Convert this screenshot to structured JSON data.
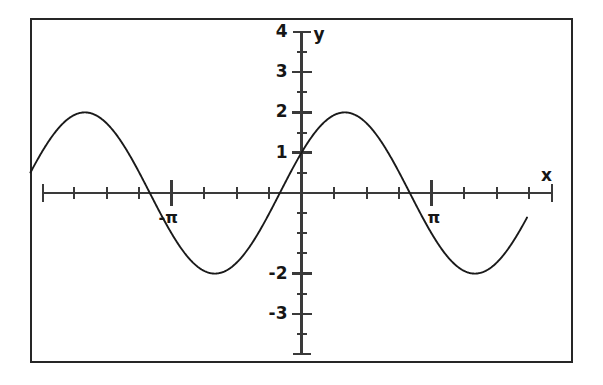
{
  "figure": {
    "background_color": "#ffffff",
    "border_color": "#262626",
    "curve_color": "#1a1a1a",
    "axis_color": "#3a3a3a",
    "text_color": "#161616"
  },
  "axes": {
    "x_axis_label": "x",
    "y_axis_label": "y",
    "x_tick_labels": [
      {
        "text": "-π",
        "value": -3.141592653589793
      },
      {
        "text": "π",
        "value": 3.141592653589793
      }
    ],
    "y_tick_labels": [
      {
        "text": "4",
        "value": 4
      },
      {
        "text": "3",
        "value": 3
      },
      {
        "text": "2",
        "value": 2
      },
      {
        "text": "1",
        "value": 1
      },
      {
        "text": "-2",
        "value": -2
      },
      {
        "text": "-3",
        "value": -3
      }
    ]
  },
  "chart_data": {
    "type": "line",
    "title": "",
    "subtitle": "",
    "xlabel": "x",
    "ylabel": "y",
    "xlim": [
      -7.35,
      5.8
    ],
    "ylim": [
      -4.0,
      4.0
    ],
    "grid": false,
    "legend": "none",
    "equation": "y = 2 sin(x + pi/6)",
    "amplitude": 2,
    "period": 6.283185307179586,
    "phase_shift": -0.5235987755982988,
    "vertical_shift": 0,
    "y_intercept": 1,
    "x_tick_interval": 0.7853981633974483,
    "y_tick_interval": 0.5,
    "x_major_ticks": [
      -3.141592653589793,
      3.141592653589793
    ],
    "y_major_ticks": [
      4,
      3,
      2,
      1,
      -2,
      -3
    ],
    "annotations": [
      {
        "text": "-π",
        "x": -3.141592653589793,
        "y": 0
      },
      {
        "text": "π",
        "x": 3.141592653589793,
        "y": 0
      },
      {
        "text": "x",
        "x": 5.6,
        "y": 0.42
      },
      {
        "text": "y",
        "x": 0.28,
        "y": 3.95
      }
    ],
    "series": [
      {
        "name": "2 sin(x + pi/6)",
        "color": "#1a1a1a",
        "x": [
          -6.55,
          -6.35,
          -6.15,
          -5.95,
          -5.75,
          -5.55,
          -5.35,
          -5.15,
          -4.95,
          -4.75,
          -4.55,
          -4.35,
          -4.15,
          -3.95,
          -3.75,
          -3.55,
          -3.35,
          -3.15,
          -2.95,
          -2.75,
          -2.55,
          -2.35,
          -2.15,
          -1.95,
          -1.75,
          -1.55,
          -1.35,
          -1.15,
          -0.95,
          -0.75,
          -0.55,
          -0.35,
          -0.15,
          0.05,
          0.25,
          0.45,
          0.65,
          0.85,
          1.05,
          1.25,
          1.45,
          1.65,
          1.85,
          2.05,
          2.25,
          2.45,
          2.65,
          2.85,
          3.05,
          3.25,
          3.45,
          3.65,
          3.85,
          4.05,
          4.25,
          4.45,
          4.65,
          4.85,
          5.05,
          5.25,
          5.45
        ],
        "y": [
          0.98,
          1.32,
          1.61,
          1.83,
          1.96,
          2.0,
          1.95,
          1.8,
          1.58,
          1.29,
          0.94,
          0.56,
          0.15,
          -0.26,
          -0.66,
          -1.03,
          -1.37,
          -1.65,
          -1.86,
          -1.97,
          -2.0,
          -1.93,
          -1.77,
          -1.53,
          -1.22,
          -0.85,
          -0.45,
          -0.04,
          0.37,
          0.76,
          1.11,
          1.42,
          1.67,
          1.85,
          1.96,
          2.0,
          1.96,
          1.84,
          1.64,
          1.38,
          1.07,
          0.72,
          0.33,
          -0.07,
          -0.48,
          -0.87,
          -1.22,
          -1.51,
          -1.74,
          -1.9,
          -1.98,
          -1.99,
          -1.91,
          -1.76,
          -1.53,
          -1.24,
          -0.9,
          -0.53,
          -0.13,
          0.27,
          0.67
        ]
      }
    ]
  }
}
